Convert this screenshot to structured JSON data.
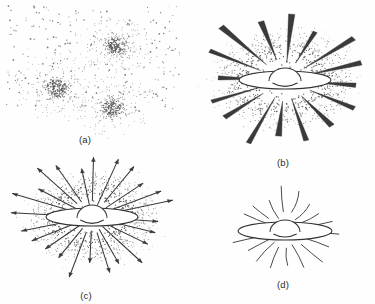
{
  "figure": {
    "kind": "four-panel-line-drawing",
    "background_color": "#fefefe",
    "ink_color": "#333333",
    "stipple_color": "#7a7a7a",
    "width": 375,
    "height": 304
  },
  "panels": [
    {
      "id": "a",
      "caption": "(a)",
      "caption_x": 85,
      "caption_y": 134,
      "box": {
        "x": 0,
        "y": 2,
        "width": 188,
        "height": 128
      },
      "description": "sparse field of scattered dots containing three dense stipple clusters",
      "features": {
        "stipple_field": true,
        "clusters": 3,
        "rays": 0,
        "arrowheads": false,
        "disc": false
      },
      "clusters": [
        {
          "cx": 116,
          "cy": 44,
          "r": 17
        },
        {
          "cx": 57,
          "cy": 86,
          "r": 20
        },
        {
          "cx": 113,
          "cy": 106,
          "r": 18
        }
      ]
    },
    {
      "id": "b",
      "caption": "(b)",
      "caption_x": 283,
      "caption_y": 157,
      "box": {
        "x": 190,
        "y": 2,
        "width": 185,
        "height": 150
      },
      "description": "edge-on disc with central bulge inside a dense halo, with solid tapered spikes converging inward",
      "features": {
        "stipple_field": true,
        "halo": true,
        "rays": 16,
        "ray_style": "solid-taper",
        "arrowheads": false,
        "disc": true
      },
      "center": {
        "cx": 95,
        "cy": 78
      },
      "disc": {
        "rx": 46,
        "ry": 9
      },
      "bulge": {
        "rx": 16,
        "ry": 13
      }
    },
    {
      "id": "c",
      "caption": "(c)",
      "caption_x": 86,
      "caption_y": 290,
      "box": {
        "x": 0,
        "y": 155,
        "width": 195,
        "height": 132
      },
      "description": "edge-on disc with central bulge inside a halo, with thin arrows pointing outward",
      "features": {
        "stipple_field": true,
        "halo": true,
        "rays": 24,
        "ray_style": "arrow-out",
        "arrowheads": true,
        "disc": true
      },
      "center": {
        "cx": 92,
        "cy": 62
      },
      "disc": {
        "rx": 46,
        "ry": 9
      },
      "bulge": {
        "rx": 15,
        "ry": 13
      }
    },
    {
      "id": "d",
      "caption": "(d)",
      "caption_x": 283,
      "caption_y": 279,
      "box": {
        "x": 196,
        "y": 186,
        "width": 179,
        "height": 100
      },
      "description": "edge-on disc with central bulge and plain curved lines radiating outward, no stipple",
      "features": {
        "stipple_field": false,
        "halo": false,
        "rays": 18,
        "ray_style": "curved-line",
        "arrowheads": false,
        "disc": true
      },
      "center": {
        "cx": 89,
        "cy": 45
      },
      "disc": {
        "rx": 47,
        "ry": 9
      },
      "bulge": {
        "rx": 15,
        "ry": 12
      }
    }
  ]
}
